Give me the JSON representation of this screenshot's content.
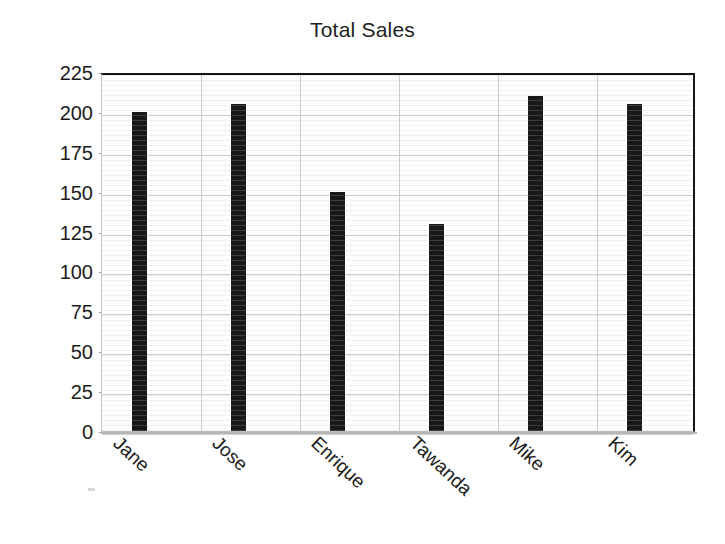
{
  "chart_data": {
    "type": "bar",
    "title": "Total Sales",
    "xlabel": "",
    "ylabel": "",
    "categories": [
      "Jane",
      "Jose",
      "Enrique",
      "Tawanda",
      "Mike",
      "Kim"
    ],
    "values": [
      200,
      205,
      150,
      130,
      210,
      205
    ],
    "ylim": [
      0,
      225
    ],
    "ytick_labels": [
      "225",
      "200",
      "175",
      "150",
      "125",
      "100",
      "75",
      "50",
      "25",
      "0"
    ],
    "ytick_values": [
      225,
      200,
      175,
      150,
      125,
      100,
      75,
      50,
      25,
      0
    ],
    "ytick_step": 25,
    "grid": "horizontal-and-vertical",
    "legend": "none",
    "bar_color": "#181818",
    "grid_color": "#cfcfcf",
    "axis_color": "#151515",
    "background_color": "#ffffff",
    "xtick_label_rotation": 43
  }
}
